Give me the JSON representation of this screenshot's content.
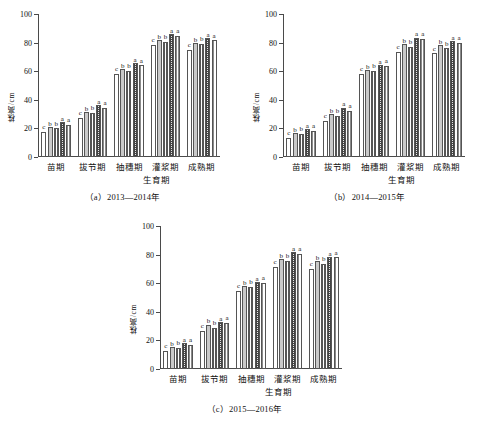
{
  "figure": {
    "ylabel": "株高/cm",
    "xlabel": "生育期",
    "yticks": [
      0,
      20,
      40,
      60,
      80,
      100
    ],
    "ylim": [
      0,
      100
    ],
    "categories": [
      "苗期",
      "拔节期",
      "抽穗期",
      "灌浆期",
      "成熟期"
    ]
  },
  "chart_data": [
    {
      "type": "bar",
      "panel": "a",
      "caption": "（a）2013—2014年",
      "title": "",
      "xlabel": "生育期",
      "ylabel": "株高/cm",
      "ylim": [
        0,
        100
      ],
      "yticks": [
        0,
        20,
        40,
        60,
        80,
        100
      ],
      "grid": false,
      "legend": "none",
      "categories": [
        "苗期",
        "拔节期",
        "抽穗期",
        "灌浆期",
        "成熟期"
      ],
      "series": [
        {
          "name": "T1",
          "pattern": "blank",
          "values": [
            17.5,
            27.5,
            58.0,
            78.5,
            75.0
          ]
        },
        {
          "name": "T2",
          "pattern": "gray",
          "values": [
            21.0,
            31.5,
            61.5,
            81.5,
            79.5
          ]
        },
        {
          "name": "T3",
          "pattern": "vstripe",
          "values": [
            20.0,
            31.0,
            60.5,
            80.5,
            79.0
          ]
        },
        {
          "name": "T4",
          "pattern": "crosshatch",
          "values": [
            24.5,
            36.5,
            65.5,
            86.0,
            83.0
          ]
        },
        {
          "name": "T5",
          "pattern": "fine-vstripe",
          "values": [
            22.5,
            34.5,
            64.0,
            84.5,
            81.5
          ]
        }
      ],
      "significance": [
        [
          "c",
          "b",
          "b",
          "a",
          "a"
        ],
        [
          "c",
          "b",
          "b",
          "a",
          "a"
        ],
        [
          "c",
          "b",
          "b",
          "a",
          "a"
        ],
        [
          "c",
          "b",
          "b",
          "a",
          "a"
        ],
        [
          "c",
          "b",
          "b",
          "a",
          "a"
        ]
      ]
    },
    {
      "type": "bar",
      "panel": "b",
      "caption": "（b）2014—2015年",
      "title": "",
      "xlabel": "生育期",
      "ylabel": "株高/cm",
      "ylim": [
        0,
        100
      ],
      "yticks": [
        0,
        20,
        40,
        60,
        80,
        100
      ],
      "grid": false,
      "legend": "none",
      "categories": [
        "苗期",
        "拔节期",
        "抽穗期",
        "灌浆期",
        "成熟期"
      ],
      "series": [
        {
          "name": "T1",
          "pattern": "blank",
          "values": [
            13.5,
            25.5,
            58.0,
            73.5,
            72.5
          ]
        },
        {
          "name": "T2",
          "pattern": "gray",
          "values": [
            16.5,
            30.0,
            61.0,
            79.0,
            78.0
          ]
        },
        {
          "name": "T3",
          "pattern": "vstripe",
          "values": [
            16.0,
            29.0,
            60.0,
            77.0,
            76.0
          ]
        },
        {
          "name": "T4",
          "pattern": "crosshatch",
          "values": [
            19.5,
            34.5,
            64.5,
            83.5,
            81.0
          ]
        },
        {
          "name": "T5",
          "pattern": "fine-vstripe",
          "values": [
            18.0,
            32.5,
            63.5,
            82.5,
            80.0
          ]
        }
      ],
      "significance": [
        [
          "c",
          "b",
          "b",
          "a",
          "a"
        ],
        [
          "c",
          "b",
          "b",
          "a",
          "a"
        ],
        [
          "c",
          "b",
          "b",
          "a",
          "a"
        ],
        [
          "c",
          "b",
          "b",
          "a",
          "a"
        ],
        [
          "c",
          "b",
          "b",
          "a",
          "a"
        ]
      ]
    },
    {
      "type": "bar",
      "panel": "c",
      "caption": "（c）2015—2016年",
      "title": "",
      "xlabel": "生育期",
      "ylabel": "株高/cm",
      "ylim": [
        0,
        100
      ],
      "yticks": [
        0,
        20,
        40,
        60,
        80,
        100
      ],
      "grid": false,
      "legend": "none",
      "categories": [
        "苗期",
        "拔节期",
        "抽穗期",
        "灌浆期",
        "成熟期"
      ],
      "series": [
        {
          "name": "T1",
          "pattern": "blank",
          "values": [
            12.5,
            26.5,
            54.5,
            71.5,
            70.0
          ]
        },
        {
          "name": "T2",
          "pattern": "gray",
          "values": [
            15.5,
            31.0,
            58.0,
            77.0,
            75.5
          ]
        },
        {
          "name": "T3",
          "pattern": "vstripe",
          "values": [
            14.5,
            29.0,
            57.5,
            75.5,
            73.5
          ]
        },
        {
          "name": "T4",
          "pattern": "crosshatch",
          "values": [
            18.0,
            33.0,
            61.0,
            81.5,
            78.5
          ]
        },
        {
          "name": "T5",
          "pattern": "fine-vstripe",
          "values": [
            17.0,
            32.0,
            60.5,
            80.5,
            78.0
          ]
        }
      ],
      "significance": [
        [
          "c",
          "b",
          "b",
          "a",
          "a"
        ],
        [
          "c",
          "b",
          "b",
          "a",
          "a"
        ],
        [
          "c",
          "b",
          "b",
          "a",
          "a"
        ],
        [
          "c",
          "b",
          "b",
          "a",
          "a"
        ],
        [
          "c",
          "b",
          "b",
          "a",
          "a"
        ]
      ]
    }
  ]
}
